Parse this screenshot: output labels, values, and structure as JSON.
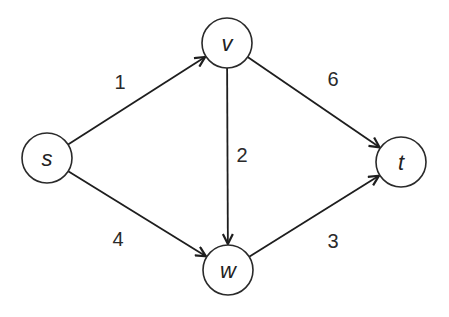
{
  "graph": {
    "type": "directed-weighted",
    "nodes": [
      {
        "id": "s",
        "label": "s",
        "x": 47,
        "y": 158
      },
      {
        "id": "v",
        "label": "v",
        "x": 227,
        "y": 43
      },
      {
        "id": "w",
        "label": "w",
        "x": 228,
        "y": 270
      },
      {
        "id": "t",
        "label": "t",
        "x": 401,
        "y": 162
      }
    ],
    "edges": [
      {
        "from": "s",
        "to": "v",
        "weight": "1",
        "label_x": 120,
        "label_y": 82
      },
      {
        "from": "s",
        "to": "w",
        "weight": "4",
        "label_x": 118,
        "label_y": 239
      },
      {
        "from": "v",
        "to": "w",
        "weight": "2",
        "label_x": 242,
        "label_y": 155
      },
      {
        "from": "v",
        "to": "t",
        "weight": "6",
        "label_x": 333,
        "label_y": 79
      },
      {
        "from": "w",
        "to": "t",
        "weight": "3",
        "label_x": 333,
        "label_y": 241
      }
    ],
    "node_radius": 25,
    "colors": {
      "stroke": "#2a2a2a",
      "fill": "#ffffff",
      "text": "#222222"
    }
  }
}
